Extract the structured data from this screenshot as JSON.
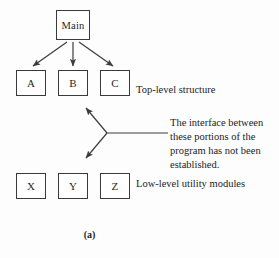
{
  "figure": {
    "caption": "(a)",
    "nodes": {
      "root": {
        "label": "Main"
      },
      "top_level": [
        {
          "label": "A"
        },
        {
          "label": "B"
        },
        {
          "label": "C"
        }
      ],
      "low_level": [
        {
          "label": "X"
        },
        {
          "label": "Y"
        },
        {
          "label": "Z"
        }
      ]
    },
    "annotations": {
      "top_level_label": "Top-level structure",
      "low_level_label": "Low-level utility modules",
      "interface_note_lines": [
        "The interface between",
        "these portions of the",
        "program has not been",
        "established."
      ]
    },
    "colors": {
      "background": "#fdfdfd",
      "box_stroke": "#3a3a3a",
      "box_fill": "#ffffff",
      "edge_stroke": "#3c3c3c",
      "text": "#232323"
    }
  }
}
